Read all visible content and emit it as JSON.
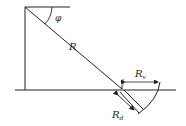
{
  "diagram": {
    "type": "geometry-sketch",
    "labels": {
      "angle": "φ",
      "radius": "R",
      "rv_main": "R",
      "rv_sub": "v",
      "rd_main": "R",
      "rd_sub": "d"
    },
    "colors": {
      "stroke": "#222222",
      "background": "#ffffff"
    }
  }
}
